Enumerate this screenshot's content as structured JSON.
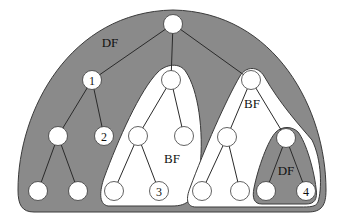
{
  "colors": {
    "background": "#ffffff",
    "region_fill": "#8a8a8a",
    "region_stroke": "#3a3a3a",
    "node_fill": "#ffffff",
    "node_stroke": "#3a3a3a",
    "edge": "#2a2a2a",
    "text": "#111111"
  },
  "regions": [
    {
      "id": "outer",
      "label": "DF",
      "kind": "depth-first",
      "label_pos": [
        110,
        47
      ]
    },
    {
      "id": "bf-left",
      "label": "BF",
      "kind": "breadth-first",
      "label_pos": [
        172,
        163
      ]
    },
    {
      "id": "bf-right",
      "label": "BF",
      "kind": "breadth-first",
      "label_pos": [
        252,
        108
      ]
    },
    {
      "id": "inner-df",
      "label": "DF",
      "kind": "depth-first",
      "label_pos": [
        286,
        175
      ]
    }
  ],
  "nodes": [
    {
      "id": "root",
      "x": 173,
      "y": 24,
      "label": ""
    },
    {
      "id": "n1",
      "x": 92,
      "y": 80,
      "label": "1"
    },
    {
      "id": "bf1top",
      "x": 171,
      "y": 80,
      "label": ""
    },
    {
      "id": "bf2top",
      "x": 251,
      "y": 80,
      "label": ""
    },
    {
      "id": "l2a",
      "x": 58,
      "y": 136,
      "label": ""
    },
    {
      "id": "n2",
      "x": 104,
      "y": 136,
      "label": "2"
    },
    {
      "id": "bf1a",
      "x": 138,
      "y": 136,
      "label": ""
    },
    {
      "id": "bf1b",
      "x": 184,
      "y": 136,
      "label": ""
    },
    {
      "id": "bf2a",
      "x": 227,
      "y": 137,
      "label": ""
    },
    {
      "id": "dftop",
      "x": 286,
      "y": 138,
      "label": ""
    },
    {
      "id": "la1",
      "x": 38,
      "y": 191,
      "label": ""
    },
    {
      "id": "la2",
      "x": 78,
      "y": 191,
      "label": ""
    },
    {
      "id": "bf1l1",
      "x": 114,
      "y": 191,
      "label": ""
    },
    {
      "id": "n3",
      "x": 159,
      "y": 191,
      "label": "3"
    },
    {
      "id": "bf2l1",
      "x": 202,
      "y": 191,
      "label": ""
    },
    {
      "id": "bf2l2",
      "x": 240,
      "y": 191,
      "label": ""
    },
    {
      "id": "dfl1",
      "x": 266,
      "y": 191,
      "label": ""
    },
    {
      "id": "n4",
      "x": 306,
      "y": 191,
      "label": "4"
    }
  ],
  "edges": [
    [
      "root",
      "n1"
    ],
    [
      "root",
      "bf1top"
    ],
    [
      "root",
      "bf2top"
    ],
    [
      "n1",
      "l2a"
    ],
    [
      "n1",
      "n2"
    ],
    [
      "l2a",
      "la1"
    ],
    [
      "l2a",
      "la2"
    ],
    [
      "bf1top",
      "bf1a"
    ],
    [
      "bf1top",
      "bf1b"
    ],
    [
      "bf1a",
      "bf1l1"
    ],
    [
      "bf1a",
      "n3"
    ],
    [
      "bf2top",
      "bf2a"
    ],
    [
      "bf2top",
      "dftop"
    ],
    [
      "bf2a",
      "bf2l1"
    ],
    [
      "bf2a",
      "bf2l2"
    ],
    [
      "dftop",
      "dfl1"
    ],
    [
      "dftop",
      "n4"
    ]
  ],
  "node_radius": 9.5
}
